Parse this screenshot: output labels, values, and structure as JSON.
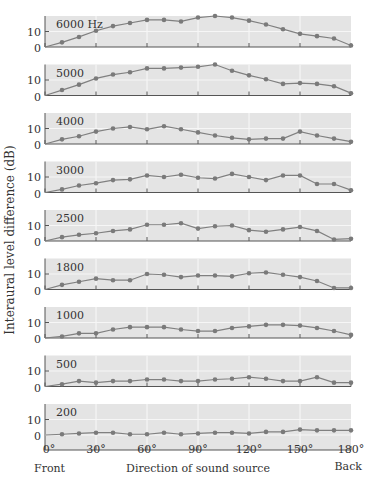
{
  "chart_data": {
    "type": "line",
    "title": "",
    "xlabel": "Direction of sound source",
    "ylabel": "Interaural level difference (dB)",
    "x_end_labels": {
      "left": "Front",
      "right": "Back"
    },
    "x": [
      0,
      10,
      20,
      30,
      40,
      50,
      60,
      70,
      80,
      90,
      100,
      110,
      120,
      130,
      140,
      150,
      160,
      170,
      180
    ],
    "x_tick_labels": [
      "0°",
      "30°",
      "60°",
      "90°",
      "120°",
      "150°",
      "180°"
    ],
    "x_ticks": [
      0,
      30,
      60,
      90,
      120,
      150,
      180
    ],
    "y_ticks": [
      0,
      10
    ],
    "ylim": [
      0,
      18
    ],
    "series": [
      {
        "name": "6000 Hz",
        "values": [
          0,
          3,
          6.5,
          10.5,
          13.5,
          15.5,
          17.5,
          17.5,
          16.5,
          19,
          20,
          19,
          17,
          14.5,
          11.5,
          8.5,
          7,
          5.5,
          1
        ]
      },
      {
        "name": "5000",
        "values": [
          0,
          3.5,
          7,
          11,
          13.5,
          15,
          17.5,
          17.5,
          18,
          18.5,
          20,
          16,
          13,
          10.5,
          7.5,
          8,
          7.5,
          6,
          1.5
        ]
      },
      {
        "name": "4000",
        "values": [
          0,
          3,
          5,
          8,
          10,
          11,
          9.5,
          11.5,
          9.5,
          7.5,
          5.5,
          4,
          3,
          3.5,
          3.5,
          8,
          5.5,
          3.5,
          1.5
        ]
      },
      {
        "name": "3000",
        "values": [
          0,
          2,
          4.5,
          6,
          8,
          8.5,
          11,
          10,
          11.5,
          9.5,
          9,
          12,
          10,
          8,
          11,
          11,
          5.5,
          5.5,
          1.5
        ]
      },
      {
        "name": "2500",
        "values": [
          0,
          2.5,
          4,
          5,
          6.5,
          7.5,
          10.5,
          10.5,
          11.5,
          8,
          9.5,
          10,
          7,
          6,
          7.5,
          9,
          6.5,
          1,
          1.5
        ]
      },
      {
        "name": "1800",
        "values": [
          0,
          3,
          5,
          7,
          6,
          6,
          10,
          9.5,
          8,
          9,
          9,
          8.5,
          10.5,
          11,
          9.5,
          8,
          5.5,
          1,
          1
        ]
      },
      {
        "name": "1000",
        "values": [
          0,
          1,
          3,
          3,
          5.5,
          7,
          7,
          7,
          5.5,
          4.5,
          4.5,
          6.5,
          7.5,
          8.5,
          8.5,
          8,
          6.5,
          4.5,
          2
        ]
      },
      {
        "name": "500",
        "values": [
          0,
          1.5,
          3.5,
          2.5,
          3.5,
          3.5,
          4.5,
          4.5,
          3.5,
          3.5,
          4.5,
          5,
          6,
          5,
          3.5,
          3.5,
          6,
          2.5,
          2.5
        ]
      },
      {
        "name": "200",
        "values": [
          0,
          0.5,
          1,
          1.5,
          1.5,
          0.5,
          0.5,
          1.5,
          0.5,
          1,
          1.5,
          1.5,
          1,
          2,
          2,
          3.5,
          3,
          3,
          3
        ]
      }
    ],
    "grid": true,
    "legend_position": "panel-labels-top-left"
  },
  "panels": [
    {
      "label": "6000 Hz"
    },
    {
      "label": "5000"
    },
    {
      "label": "4000"
    },
    {
      "label": "3000"
    },
    {
      "label": "2500"
    },
    {
      "label": "1800"
    },
    {
      "label": "1000"
    },
    {
      "label": "500"
    },
    {
      "label": "200"
    }
  ],
  "axis": {
    "y_label": "Interaural level difference (dB)",
    "y_tick_10": "10",
    "y_tick_0": "0",
    "x_label": "Direction of sound source",
    "front": "Front",
    "back": "Back"
  },
  "colors": {
    "panel_bg": "#e4e4e4",
    "grid": "#f6f6f6",
    "line": "#808080",
    "marker": "#7a7a7a",
    "axis": "#555555",
    "text": "#333333"
  }
}
